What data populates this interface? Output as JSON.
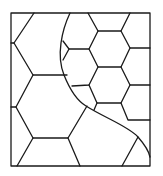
{
  "diagram": {
    "type": "line-drawing",
    "stroke_color": "#1a1a1a",
    "background_color": "#ffffff",
    "frame": {
      "x": 11,
      "y": 13,
      "width": 139,
      "height": 153
    },
    "regions": [
      {
        "name": "large-hex-region",
        "side": "left"
      },
      {
        "name": "small-hex-region",
        "side": "right"
      }
    ]
  }
}
